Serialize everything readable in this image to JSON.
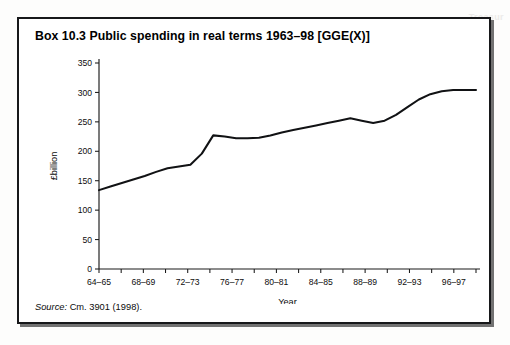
{
  "page": {
    "ghost_text": "Treasur"
  },
  "box": {
    "title": "Box 10.3  Public spending in real terms 1963–98 [GGE(X)]",
    "source_label": "Source:",
    "source_text": " Cm. 3901 (1998)."
  },
  "chart_data": {
    "type": "line",
    "title": "Public spending in real terms 1963–98 [GGE(X)]",
    "xlabel": "Year",
    "ylabel": "£billion",
    "ylim": [
      0,
      350
    ],
    "yticks": [
      0,
      50,
      100,
      150,
      200,
      250,
      300,
      350
    ],
    "ytick_labels": [
      "0",
      "50",
      "100",
      "150",
      "200",
      "250",
      "300",
      "350"
    ],
    "xtick_labels": [
      "64–65",
      "68–69",
      "72–73",
      "76–77",
      "80–81",
      "84–85",
      "88–89",
      "92–93",
      "96–97"
    ],
    "minor_tick_count": 17,
    "grid": false,
    "legend": "none",
    "line_color": "#111214",
    "x": [
      "64–65",
      "65–66",
      "66–67",
      "67–68",
      "68–69",
      "69–70",
      "70–71",
      "71–72",
      "72–73",
      "73–74",
      "74–75",
      "75–76",
      "76–77",
      "77–78",
      "78–79",
      "79–80",
      "80–81",
      "81–82",
      "82–83",
      "83–84",
      "84–85",
      "85–86",
      "86–87",
      "87–88",
      "88–89",
      "89–90",
      "90–91",
      "91–92",
      "92–93",
      "93–94",
      "94–95",
      "95–96",
      "96–97",
      "97–98"
    ],
    "values": [
      134,
      140,
      146,
      152,
      158,
      165,
      171,
      174,
      177,
      196,
      227,
      225,
      222,
      222,
      223,
      227,
      232,
      236,
      240,
      244,
      248,
      252,
      256,
      252,
      248,
      252,
      262,
      275,
      288,
      297,
      302,
      304,
      304,
      304
    ],
    "series": [
      {
        "name": "General Government Expenditure (X)",
        "values": [
          134,
          140,
          146,
          152,
          158,
          165,
          171,
          174,
          177,
          196,
          227,
          225,
          222,
          222,
          223,
          227,
          232,
          236,
          240,
          244,
          248,
          252,
          256,
          252,
          248,
          252,
          262,
          275,
          288,
          297,
          302,
          304,
          304,
          304
        ]
      }
    ]
  }
}
